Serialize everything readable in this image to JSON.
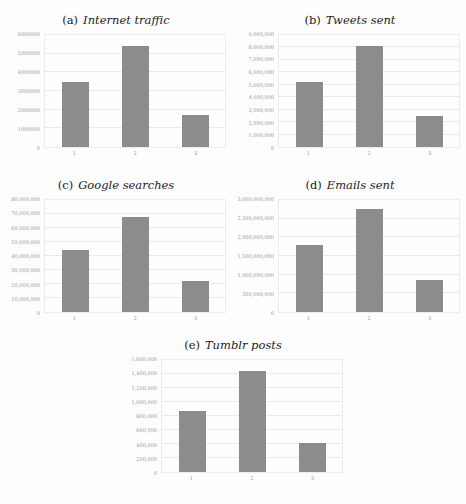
{
  "figure": {
    "background": "#fdfdfd"
  },
  "style": {
    "bar_color": "#8c8c8c",
    "grid_color": "#ebebeb",
    "plot_border_color": "#ededed",
    "tick_label_color": "#999999",
    "title_color": "#1c1c1c"
  },
  "chart_data": [
    {
      "type": "bar",
      "caption_label": "(a)",
      "title": "Internet traffic",
      "categories": [
        "1",
        "2",
        "3"
      ],
      "values": [
        3500000,
        5400000,
        1700000
      ],
      "xlabel": "",
      "ylabel": "",
      "ylim": [
        0,
        6000000
      ],
      "ytick_step": 1000000,
      "ytick_labels": [
        "6000000",
        "5000000",
        "4000000",
        "3000000",
        "2000000",
        "1000000",
        "0"
      ],
      "grid": true,
      "legend": null
    },
    {
      "type": "bar",
      "caption_label": "(b)",
      "title": "Tweets sent",
      "categories": [
        "1",
        "2",
        "3"
      ],
      "values": [
        5250000,
        8100000,
        2500000
      ],
      "xlabel": "",
      "ylabel": "",
      "ylim": [
        0,
        9000000
      ],
      "ytick_step": 1000000,
      "ytick_labels": [
        "9,000,000",
        "8,000,000",
        "7,000,000",
        "6,000,000",
        "5,000,000",
        "4,000,000",
        "3,000,000",
        "2,000,000",
        "1,000,000",
        "0"
      ],
      "grid": true,
      "legend": null
    },
    {
      "type": "bar",
      "caption_label": "(c)",
      "title": "Google searches",
      "categories": [
        "1",
        "2",
        "3"
      ],
      "values": [
        44500000,
        68000000,
        22000000
      ],
      "xlabel": "",
      "ylabel": "",
      "ylim": [
        0,
        80000000
      ],
      "ytick_step": 10000000,
      "ytick_labels": [
        "80,000,000",
        "70,000,000",
        "60,000,000",
        "50,000,000",
        "40,000,000",
        "30,000,000",
        "20,000,000",
        "10,000,000",
        "0"
      ],
      "grid": true,
      "legend": null
    },
    {
      "type": "bar",
      "caption_label": "(d)",
      "title": "Emails sent",
      "categories": [
        "1",
        "2",
        "3"
      ],
      "values": [
        1800000000,
        2760000000,
        860000000
      ],
      "xlabel": "",
      "ylabel": "",
      "ylim": [
        0,
        3000000000
      ],
      "ytick_step": 500000000,
      "ytick_labels": [
        "3,000,000,000",
        "2,500,000,000",
        "2,000,000,000",
        "1,500,000,000",
        "1,000,000,000",
        "500,000,000",
        "0"
      ],
      "grid": true,
      "legend": null
    },
    {
      "type": "bar",
      "caption_label": "(e)",
      "title": "Tumblr posts",
      "categories": [
        "1",
        "2",
        "3"
      ],
      "values": [
        870000,
        1440000,
        410000
      ],
      "xlabel": "",
      "ylabel": "",
      "ylim": [
        0,
        1600000
      ],
      "ytick_step": 200000,
      "ytick_labels": [
        "1,600,000",
        "1,400,000",
        "1,200,000",
        "1,000,000",
        "800,000",
        "600,000",
        "400,000",
        "200,000",
        "0"
      ],
      "grid": true,
      "legend": null
    }
  ]
}
